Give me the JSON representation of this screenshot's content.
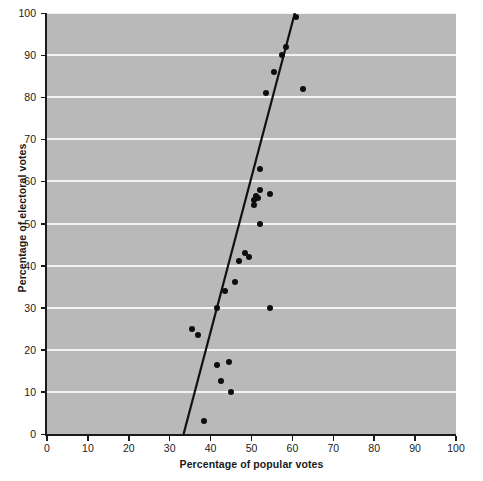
{
  "chart_data": {
    "type": "scatter",
    "title": "",
    "xlabel": "Percentage of popular votes",
    "ylabel": "Percentage of electoral votes",
    "xlim": [
      0,
      100
    ],
    "ylim": [
      0,
      100
    ],
    "xticks": [
      0,
      10,
      20,
      30,
      40,
      50,
      60,
      70,
      80,
      90,
      100
    ],
    "yticks": [
      0,
      10,
      20,
      30,
      40,
      50,
      60,
      70,
      80,
      90,
      100
    ],
    "xtick_labels": [
      "0",
      "10",
      "20",
      "30",
      "40",
      "50",
      "60",
      "70",
      "80",
      "90",
      "100"
    ],
    "ytick_labels": [
      "0",
      "10",
      "20",
      "30",
      "40",
      "50",
      "60",
      "70",
      "80",
      "90",
      "100"
    ],
    "grid": "horizontal",
    "gridline_color": "#f2f2f2",
    "plot_background": "#b9b9b9",
    "page_background": "#ffffff",
    "marker_color": "#0d0d0d",
    "marker_size": 6,
    "legend": null,
    "points": [
      {
        "x": 61.0,
        "y": 99.0
      },
      {
        "x": 58.5,
        "y": 92.0
      },
      {
        "x": 57.5,
        "y": 90.0
      },
      {
        "x": 55.5,
        "y": 86.0
      },
      {
        "x": 53.5,
        "y": 81.0
      },
      {
        "x": 62.5,
        "y": 82.0
      },
      {
        "x": 52.0,
        "y": 63.0
      },
      {
        "x": 52.0,
        "y": 58.0
      },
      {
        "x": 54.5,
        "y": 57.0
      },
      {
        "x": 51.0,
        "y": 56.5
      },
      {
        "x": 51.5,
        "y": 56.0
      },
      {
        "x": 50.5,
        "y": 55.5
      },
      {
        "x": 50.5,
        "y": 54.5
      },
      {
        "x": 52.0,
        "y": 50.0
      },
      {
        "x": 48.5,
        "y": 43.0
      },
      {
        "x": 49.5,
        "y": 42.0
      },
      {
        "x": 47.0,
        "y": 41.0
      },
      {
        "x": 46.0,
        "y": 36.0
      },
      {
        "x": 43.5,
        "y": 34.0
      },
      {
        "x": 54.5,
        "y": 30.0
      },
      {
        "x": 41.5,
        "y": 30.0
      },
      {
        "x": 35.5,
        "y": 25.0
      },
      {
        "x": 37.0,
        "y": 23.5
      },
      {
        "x": 44.5,
        "y": 17.0
      },
      {
        "x": 41.5,
        "y": 16.5
      },
      {
        "x": 42.5,
        "y": 12.5
      },
      {
        "x": 45.0,
        "y": 10.0
      },
      {
        "x": 38.5,
        "y": 3.0
      }
    ],
    "fit_line": {
      "label": "regression-line",
      "color": "#111111",
      "width": 2.2,
      "x_start": 33.4,
      "y_start": 0,
      "x_end": 60.6,
      "y_end": 100
    }
  }
}
